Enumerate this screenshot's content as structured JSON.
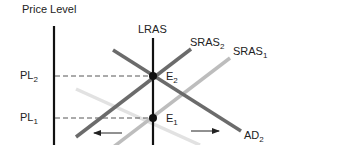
{
  "diagram": {
    "y_axis_label": "Price Level",
    "curves": {
      "lras": {
        "label": "LRAS",
        "color": "#111111"
      },
      "sras2": {
        "label": "SRAS",
        "subscript": "2",
        "color": "#6b6b6b"
      },
      "sras1": {
        "label": "SRAS",
        "subscript": "1",
        "color": "#bdbdbd"
      },
      "ad2": {
        "label": "AD",
        "subscript": "2",
        "color": "#6b6b6b"
      },
      "ad1": {
        "label": "",
        "color": "#e0e0e0"
      }
    },
    "price_levels": {
      "pl2": {
        "label": "PL",
        "subscript": "2"
      },
      "pl1": {
        "label": "PL",
        "subscript": "1"
      }
    },
    "equilibria": {
      "e2": {
        "label": "E",
        "subscript": "2"
      },
      "e1": {
        "label": "E",
        "subscript": "1"
      }
    },
    "arrows": [
      {
        "direction": "left",
        "meaning": "SRAS shift left"
      },
      {
        "direction": "right",
        "meaning": "AD shift right"
      }
    ]
  }
}
